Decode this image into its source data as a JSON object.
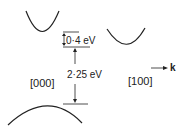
{
  "diagram": {
    "type": "band-structure",
    "labels": {
      "gap_small": "0·4 eV",
      "gap_main": "2·25 eV",
      "point_gamma": "[000]",
      "point_x": "[100]",
      "axis_k": "k"
    },
    "colors": {
      "line": "#222222",
      "background": "#ffffff"
    }
  }
}
